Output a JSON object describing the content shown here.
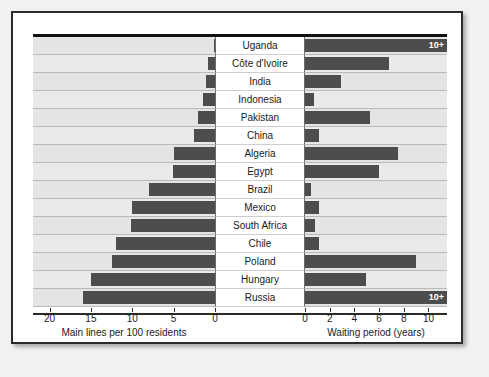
{
  "chart_data": {
    "type": "bar",
    "title": "",
    "layout": "bidirectional paired horizontal bars with centered category labels",
    "categories": [
      "Uganda",
      "Côte d'Ivoire",
      "India",
      "Indonesia",
      "Pakistan",
      "China",
      "Algeria",
      "Egypt",
      "Brazil",
      "Mexico",
      "South Africa",
      "Chile",
      "Poland",
      "Hungary",
      "Russia"
    ],
    "grid": true,
    "legend": "none",
    "series": [
      {
        "name": "Main lines per 100 residents",
        "side": "left",
        "xlabel": "Main lines per 100 residents",
        "xlim": [
          0,
          22
        ],
        "direction": "right-to-left",
        "ticks": [
          20,
          15,
          10,
          5,
          0
        ],
        "tick_labels": [
          "20",
          "15",
          "10",
          "5",
          "0"
        ],
        "values": [
          0.1,
          0.8,
          1.1,
          1.5,
          2.0,
          2.5,
          5.0,
          5.1,
          8.0,
          10.0,
          10.2,
          12.0,
          12.5,
          15.0,
          16.0
        ]
      },
      {
        "name": "Waiting period (years)",
        "side": "right",
        "xlabel": "Waiting period (years)",
        "xlim": [
          0,
          11.5
        ],
        "direction": "left-to-right",
        "ticks": [
          0,
          2,
          4,
          6,
          8,
          10
        ],
        "tick_labels": [
          "0",
          "2",
          "4",
          "6",
          "8",
          "10"
        ],
        "values": [
          11.5,
          6.8,
          2.9,
          0.7,
          5.3,
          1.1,
          7.5,
          6.0,
          0.5,
          1.1,
          0.8,
          1.1,
          9.0,
          4.9,
          11.5
        ],
        "capped_labels": {
          "Uganda": "10+",
          "Russia": "10+"
        }
      }
    ]
  }
}
